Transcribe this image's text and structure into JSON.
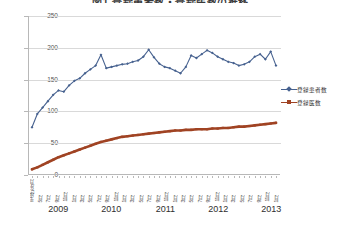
{
  "chart": {
    "title": "図1 登録患者数・登録医数の推移",
    "title_clipped": true
  },
  "legend": {
    "position": "right",
    "items": [
      {
        "label": "登録患者数",
        "color": "#46618f",
        "marker": "diamond"
      },
      {
        "label": "登録医数",
        "color": "#a04323",
        "marker": "square"
      }
    ]
  },
  "axes": {
    "y": {
      "labels": [
        "250",
        "200",
        "150",
        "100",
        "50",
        "0"
      ],
      "values": [
        250,
        200,
        150,
        100,
        50,
        0
      ],
      "min": 0,
      "max": 250,
      "step": 50
    },
    "x": {
      "years": [
        "2009",
        "2010",
        "2011",
        "2012",
        "2013"
      ],
      "month_labels": [
        "平成21年3月",
        "5月",
        "7月",
        "9月",
        "11月",
        "1月",
        "3月",
        "5月",
        "7月",
        "9月",
        "11月",
        "1月",
        "3月",
        "5月",
        "7月",
        "9月",
        "11月",
        "1月",
        "3月",
        "5月",
        "7月",
        "9月",
        "11月",
        "1月",
        "3月",
        "5月",
        "7月",
        "9月",
        "11月",
        "1月"
      ]
    }
  },
  "chart_data": {
    "type": "line",
    "title": "図1 登録患者数・登録医数の推移",
    "xlabel": "",
    "ylabel": "",
    "ylim": [
      0,
      250
    ],
    "grid": true,
    "legend_position": "right",
    "x": [
      "2009-03",
      "2009-04",
      "2009-05",
      "2009-06",
      "2009-07",
      "2009-08",
      "2009-09",
      "2009-10",
      "2009-11",
      "2009-12",
      "2010-01",
      "2010-02",
      "2010-03",
      "2010-04",
      "2010-05",
      "2010-06",
      "2010-07",
      "2010-08",
      "2010-09",
      "2010-10",
      "2010-11",
      "2010-12",
      "2011-01",
      "2011-02",
      "2011-03",
      "2011-04",
      "2011-05",
      "2011-06",
      "2011-07",
      "2011-08",
      "2011-09",
      "2011-10",
      "2011-11",
      "2011-12",
      "2012-01",
      "2012-02",
      "2012-03",
      "2012-04",
      "2012-05",
      "2012-06",
      "2012-07",
      "2012-08",
      "2012-09",
      "2012-10",
      "2012-11",
      "2012-12",
      "2013-01"
    ],
    "series": [
      {
        "name": "登録患者数",
        "color": "#46618f",
        "values": [
          75,
          96,
          106,
          116,
          126,
          133,
          131,
          141,
          148,
          152,
          160,
          166,
          172,
          189,
          168,
          170,
          172,
          174,
          175,
          178,
          180,
          186,
          197,
          185,
          175,
          170,
          168,
          164,
          160,
          170,
          188,
          184,
          190,
          196,
          192,
          186,
          182,
          178,
          176,
          172,
          174,
          178,
          186,
          190,
          182,
          194,
          172
        ]
      },
      {
        "name": "登録医数",
        "color": "#a04323",
        "values": [
          9,
          12,
          16,
          20,
          24,
          28,
          31,
          34,
          37,
          40,
          43,
          46,
          49,
          52,
          54,
          56,
          58,
          60,
          61,
          62,
          63,
          64,
          65,
          66,
          67,
          68,
          69,
          70,
          70,
          71,
          71,
          72,
          72,
          72,
          73,
          73,
          74,
          74,
          75,
          76,
          76,
          77,
          78,
          79,
          80,
          81,
          82
        ]
      }
    ]
  },
  "colors": {
    "series_patients": "#46618f",
    "series_doctors": "#a04323",
    "grid": "#d9d9d9",
    "axis": "#b8b8b8",
    "text": "#333333"
  }
}
